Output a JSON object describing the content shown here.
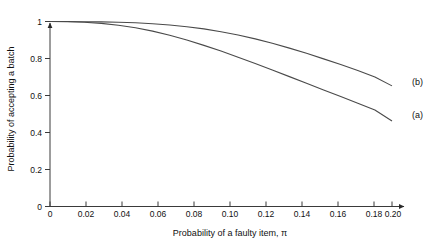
{
  "chart_data": {
    "type": "line",
    "title": "",
    "subtitle": "",
    "xlabel": "Probability of a faulty item, π",
    "ylabel": "Probability of accepting a batch",
    "xlim": [
      0,
      0.2
    ],
    "ylim": [
      0,
      1
    ],
    "grid": false,
    "legend_position": "right-inline-end-of-curve",
    "xticks": [
      0,
      0.02,
      0.04,
      0.06,
      0.08,
      0.1,
      0.12,
      0.14,
      0.16,
      0.18,
      0.2
    ],
    "xtick_labels": [
      "0",
      "0.02",
      "0.04",
      "0.06",
      "0.08",
      "0.10",
      "0.12",
      "0.14",
      "0.16",
      "0.18",
      "0.20"
    ],
    "yticks": [
      0,
      0.2,
      0.4,
      0.6,
      0.8,
      1
    ],
    "ytick_labels": [
      "0",
      "0.2",
      "0.4",
      "0.6",
      "0.8",
      "1"
    ],
    "x": [
      0,
      0.01,
      0.02,
      0.03,
      0.04,
      0.05,
      0.06,
      0.07,
      0.08,
      0.09,
      0.1,
      0.11,
      0.12,
      0.13,
      0.14,
      0.15,
      0.16,
      0.17,
      0.18,
      0.19,
      0.2
    ],
    "series": [
      {
        "name": "(a)",
        "label": "(a)",
        "color": "#4a4a4a",
        "values": [
          1.0,
          0.999,
          0.996,
          0.99,
          0.98,
          0.966,
          0.948,
          0.926,
          0.9,
          0.871,
          0.84,
          0.807,
          0.773,
          0.738,
          0.702,
          0.666,
          0.63,
          0.594,
          0.558,
          0.522,
          0.462
        ]
      },
      {
        "name": "(b)",
        "label": "(b)",
        "color": "#4a4a4a",
        "values": [
          1.0,
          1.0,
          0.999,
          0.998,
          0.996,
          0.993,
          0.988,
          0.981,
          0.972,
          0.96,
          0.945,
          0.927,
          0.906,
          0.882,
          0.856,
          0.828,
          0.798,
          0.767,
          0.735,
          0.7,
          0.652
        ]
      }
    ],
    "annotations": [
      {
        "text": "(a)",
        "x": 0.2,
        "y": 0.462
      },
      {
        "text": "(b)",
        "x": 0.2,
        "y": 0.652
      }
    ]
  },
  "axis": {
    "x_title": "Probability of a faulty item, π",
    "y_title": "Probability of accepting a batch"
  }
}
